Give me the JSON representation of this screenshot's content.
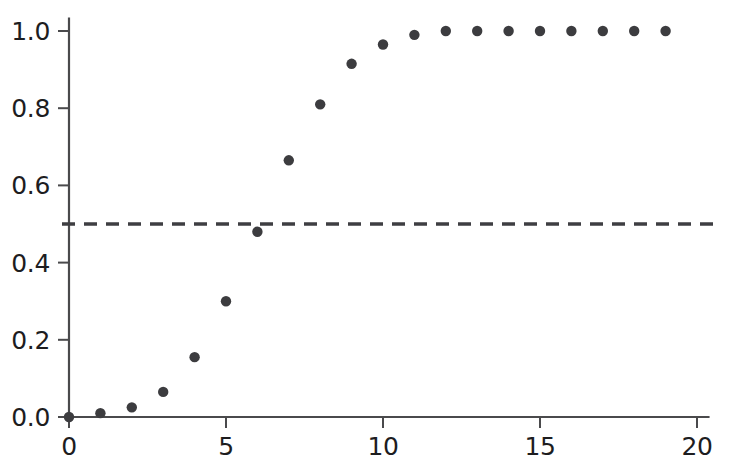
{
  "chart_data": {
    "type": "scatter",
    "title": "",
    "subtitle": "",
    "xlabel": "",
    "ylabel": "",
    "xlim": [
      0,
      20.4
    ],
    "ylim": [
      0.0,
      1.035
    ],
    "grid": false,
    "legend": "none",
    "x": [
      0,
      1,
      2,
      3,
      4,
      5,
      6,
      7,
      8,
      9,
      10,
      11,
      12,
      13,
      14,
      15,
      16,
      17,
      18,
      19
    ],
    "values": [
      0.0,
      0.01,
      0.025,
      0.065,
      0.155,
      0.3,
      0.48,
      0.665,
      0.81,
      0.915,
      0.965,
      0.99,
      1.0,
      1.0,
      1.0,
      1.0,
      1.0,
      1.0,
      1.0,
      1.0
    ],
    "series": [
      {
        "name": "cumulative-probability",
        "marker": "filled-circle",
        "color": "#3c3c3f",
        "values": [
          0.0,
          0.01,
          0.025,
          0.065,
          0.155,
          0.3,
          0.48,
          0.665,
          0.81,
          0.915,
          0.965,
          0.99,
          1.0,
          1.0,
          1.0,
          1.0,
          1.0,
          1.0,
          1.0,
          1.0
        ]
      }
    ],
    "annotations": [
      {
        "name": "threshold-line",
        "type": "hline",
        "y": 0.5,
        "style": "dashed",
        "color": "#3e3e42",
        "label": ""
      }
    ],
    "x_ticks": [
      {
        "value": 0,
        "label": "0"
      },
      {
        "value": 5,
        "label": "5"
      },
      {
        "value": 10,
        "label": "10"
      },
      {
        "value": 15,
        "label": "15"
      },
      {
        "value": 20,
        "label": "20"
      }
    ],
    "y_ticks": [
      {
        "value": 0.0,
        "label": "0.0"
      },
      {
        "value": 0.2,
        "label": "0.2"
      },
      {
        "value": 0.4,
        "label": "0.4"
      },
      {
        "value": 0.6,
        "label": "0.6"
      },
      {
        "value": 0.8,
        "label": "0.8"
      },
      {
        "value": 1.0,
        "label": "1.0"
      }
    ],
    "colors": {
      "axis": "#4a4a4c",
      "marker": "#3c3c3f",
      "threshold": "#3e3e42",
      "text": "#1d1d1f",
      "background": "#ffffff"
    }
  }
}
